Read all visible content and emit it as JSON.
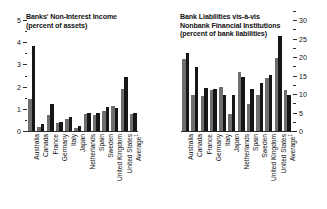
{
  "chart_data": [
    {
      "type": "bar",
      "panel": "left",
      "title": "Banks' Non-Interest Income",
      "subtitle": "(percent of assets)",
      "xlabel": "",
      "ylabel": "",
      "ylim": [
        0,
        5
      ],
      "yticks": [
        0,
        1,
        2,
        3,
        4,
        5
      ],
      "ytick_labels": [
        "0",
        "1",
        "2",
        "3",
        "4",
        "5"
      ],
      "minor_ticks": true,
      "grid": false,
      "legend": "none",
      "axis_side": "left",
      "categories": [
        "Australia",
        "Canada",
        "France",
        "Germany",
        "Italy",
        "Japan",
        "Netherlands",
        "Spain",
        "Sweden",
        "United Kingdom",
        "United States",
        "Average"
      ],
      "series": [
        {
          "name": "light",
          "color": "#6e6e6e",
          "values": [
            1.45,
            0.18,
            0.72,
            0.34,
            0.52,
            0.12,
            0.78,
            0.72,
            0.92,
            1.12,
            1.88,
            0.78
          ]
        },
        {
          "name": "dark",
          "color": "#161616",
          "values": [
            3.85,
            0.3,
            1.22,
            0.42,
            0.62,
            0.22,
            0.8,
            0.8,
            1.1,
            1.05,
            2.42,
            0.8
          ]
        }
      ]
    },
    {
      "type": "bar",
      "panel": "right",
      "title": "Bank Liabilities vis-à-vis",
      "title_line2": "Nonbank Financial Institutions",
      "subtitle": "(percent of bank liabilities)",
      "xlabel": "",
      "ylabel": "",
      "ylim": [
        0,
        30
      ],
      "yticks": [
        0,
        5,
        10,
        15,
        20,
        25,
        30
      ],
      "ytick_labels": [
        "0",
        "5",
        "10",
        "15",
        "20",
        "25",
        "30"
      ],
      "minor_ticks": true,
      "grid": false,
      "legend": "none",
      "axis_side": "right",
      "categories": [
        "Australia",
        "Canada",
        "France",
        "Germany",
        "Italy",
        "Japan",
        "Netherlands",
        "Spain",
        "Sweden",
        "United Kingdom",
        "United States",
        "Average"
      ],
      "series": [
        {
          "name": "light",
          "color": "#6e6e6e",
          "values": [
            19.4,
            9.8,
            9.5,
            11.2,
            11.8,
            4.6,
            16.0,
            7.4,
            9.6,
            14.2,
            19.8,
            11.2
          ]
        },
        {
          "name": "dark",
          "color": "#161616",
          "values": [
            21.0,
            17.2,
            11.6,
            11.4,
            9.7,
            9.6,
            14.5,
            11.4,
            12.9,
            15.1,
            25.6,
            9.7
          ]
        }
      ]
    }
  ],
  "footnote_marker": "1",
  "axis": {
    "left": {
      "labels": [
        "5",
        "4",
        "3",
        "2",
        "1",
        "0"
      ]
    },
    "right": {
      "labels": [
        "30",
        "25",
        "20",
        "15",
        "10",
        "5",
        "0"
      ]
    }
  },
  "titles": {
    "left_line1": "Banks' Non-Interest Income",
    "left_line2": "(percent of assets)",
    "right_line1": "Bank Liabilities vis-à-vis",
    "right_line2": "Nonbank Financial Institutions",
    "right_line3": "(percent of bank liabilities)"
  }
}
